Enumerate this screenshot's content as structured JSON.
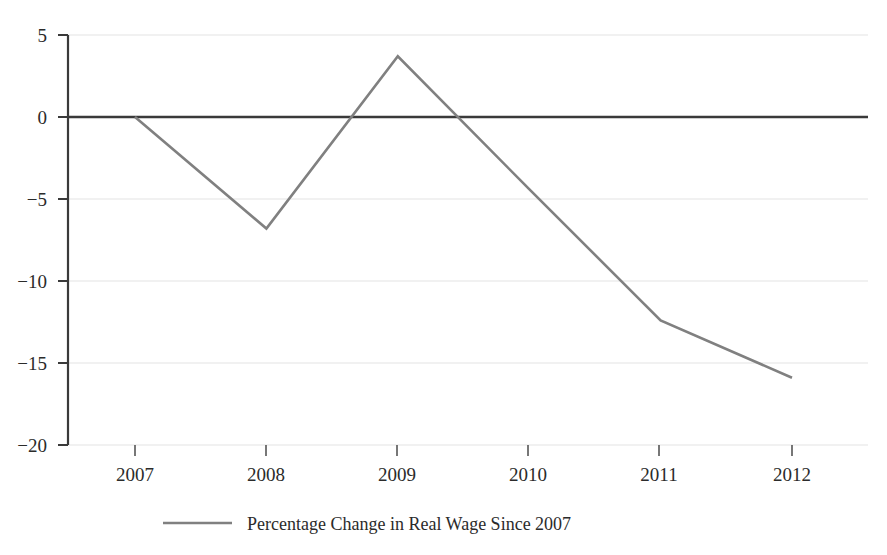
{
  "chart_data": {
    "type": "line",
    "title": "",
    "subtitle": "",
    "xlabel": "",
    "ylabel": "",
    "categories": [
      "2007",
      "2008",
      "2009",
      "2010",
      "2011",
      "2012"
    ],
    "x": [
      2007,
      2008,
      2009,
      2010,
      2011,
      2012
    ],
    "series": [
      {
        "name": "Percentage Change in Real Wage Since 2007",
        "values": [
          0,
          -6.8,
          3.7,
          -4.4,
          -12.4,
          -15.9
        ],
        "color": "#808080"
      }
    ],
    "ylim": [
      -20,
      5
    ],
    "yticks": [
      5,
      0,
      -5,
      -10,
      -15,
      -20
    ],
    "ytick_labels": [
      "5",
      "0",
      "−5",
      "−10",
      "−15",
      "−20"
    ],
    "xticks": [
      2007,
      2008,
      2009,
      2010,
      2011,
      2012
    ],
    "xtick_labels": [
      "2007",
      "2008",
      "2009",
      "2010",
      "2011",
      "2012"
    ],
    "grid": true,
    "grid_axis": "y",
    "grid_color": "#e3e3e3",
    "zero_line": true,
    "zero_line_color": "#3a3a3a",
    "axis_color": "#3a3a3a",
    "legend": {
      "position": "bottom-center",
      "entries": [
        {
          "label": "Percentage Change in Real Wage Since 2007",
          "color": "#808080",
          "marker": "line"
        }
      ]
    },
    "background": "#ffffff"
  }
}
